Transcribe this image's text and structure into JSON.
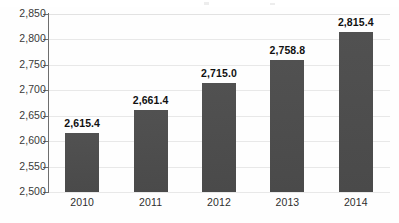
{
  "chart_data": {
    "type": "bar",
    "title": "",
    "subtitle": "",
    "xlabel": "",
    "ylabel": "",
    "categories": [
      "2010",
      "2011",
      "2012",
      "2013",
      "2014"
    ],
    "values": [
      2615.4,
      2661.4,
      2715.0,
      2758.8,
      2815.4
    ],
    "value_labels": [
      "2,615.4",
      "2,661.4",
      "2,715.0",
      "2,758.8",
      "2,815.4"
    ],
    "ylim": [
      2500,
      2850
    ],
    "ytick_values": [
      2850,
      2800,
      2750,
      2700,
      2650,
      2600,
      2550,
      2500
    ],
    "ytick_labels": [
      "2,850",
      "2,800",
      "2,750",
      "2,700",
      "2,650",
      "2,600",
      "2,550",
      "2,500"
    ],
    "grid": true,
    "legend": false,
    "legend_position": "none",
    "series": [
      {
        "name": "",
        "values": [
          2615.4,
          2661.4,
          2715.0,
          2758.8,
          2815.4
        ]
      }
    ],
    "colors": {
      "bar": "#4d4d4d",
      "gridline": "#e8e8e8",
      "axis": "#6e6e6e",
      "value_label": "#111111",
      "tick_label": "#3a3a3a",
      "background": "#ffffff"
    }
  }
}
